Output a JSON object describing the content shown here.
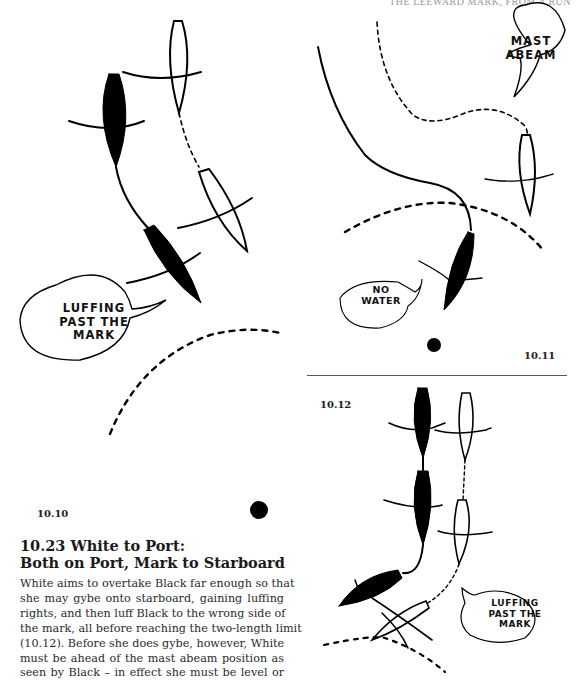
{
  "running_head": "THE LEEWARD MARK, FROM A RUN",
  "figures": [
    {
      "id": "10.10",
      "label": "10.10",
      "bubbles": [
        {
          "lines": [
            "LUFFING",
            "PAST THE",
            "MARK"
          ]
        }
      ]
    },
    {
      "id": "10.11",
      "label": "10.11",
      "bubbles": [
        {
          "lines": [
            "MAST",
            "ABEAM"
          ]
        },
        {
          "lines": [
            "NO",
            "WATER"
          ]
        }
      ]
    },
    {
      "id": "10.12",
      "label": "10.12",
      "bubbles": [
        {
          "lines": [
            "LUFFING",
            "PAST THE",
            "MARK"
          ]
        }
      ]
    }
  ],
  "section": {
    "number": "10.23",
    "heading_lines": [
      "10.23 White to Port:",
      "Both on Port, Mark to Starboard"
    ],
    "body_lines": [
      "White aims to overtake Black far enough so that",
      "she may gybe onto starboard, gaining luffing",
      "rights, and then luff Black to the wrong side of",
      "the mark, all before reaching the two-length limit",
      "(10.12). Before she does gybe, however, White",
      "must be ahead of the mast abeam position as",
      "seen by Black – in effect she must be level or"
    ]
  },
  "colors": {
    "ink": "#000000",
    "paper": "#ffffff",
    "running_head": "#9a9a9a",
    "divider": "#555555"
  }
}
